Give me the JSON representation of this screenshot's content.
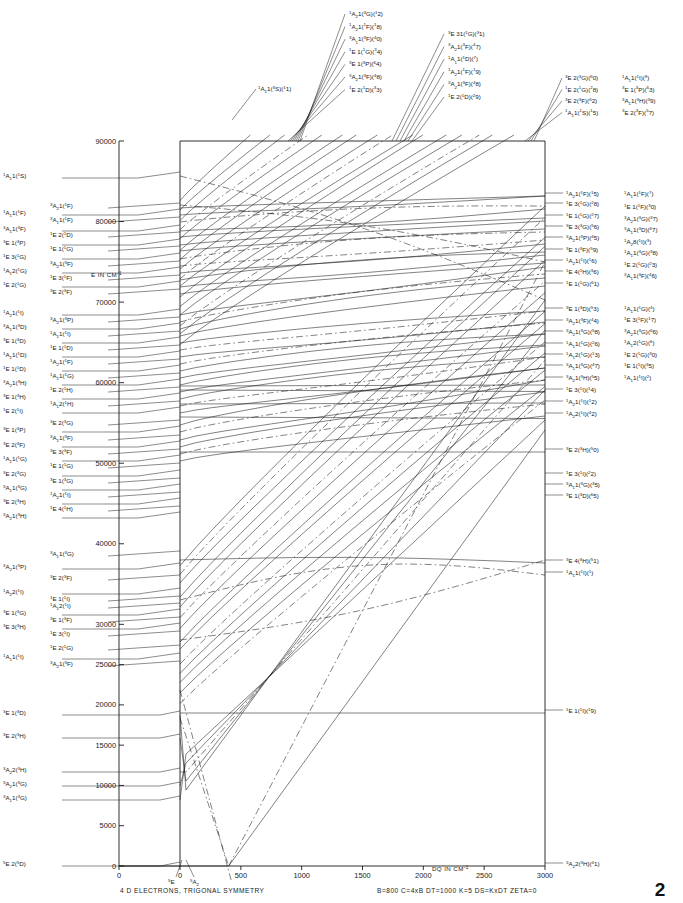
{
  "figure": {
    "caption": "4 D ELECTRONS, TRIGONAL SYMMETRY",
    "parameters": "B=800   C=4xB   DT=1000    K=5    DS=KxDT   ZETA=0",
    "page_number": "2"
  },
  "axes": {
    "y_title": "E IN CM",
    "y_title_sup": "-1",
    "y_ticks": [
      {
        "label": "0",
        "value": 0
      },
      {
        "label": "5000",
        "value": 5000
      },
      {
        "label": "10000",
        "value": 10000
      },
      {
        "label": "15000",
        "value": 15000
      },
      {
        "label": "20000",
        "value": 20000
      },
      {
        "label": "25000",
        "value": 25000
      },
      {
        "label": "30000",
        "value": 30000
      },
      {
        "label": "40000",
        "value": 40000
      },
      {
        "label": "50000",
        "value": 50000
      },
      {
        "label": "60000",
        "value": 60000
      },
      {
        "label": "70000",
        "value": 70000
      },
      {
        "label": "80000",
        "value": 80000
      },
      {
        "label": "90000",
        "value": 90000
      }
    ],
    "x_title": "DQ IN CM",
    "x_title_sup": "-1",
    "x_ticks": [
      "0",
      "500",
      "1000",
      "1500",
      "2000",
      "2500",
      "3000"
    ],
    "x_range": [
      0,
      3000
    ],
    "y_range": [
      0,
      90000
    ],
    "crossing_labels": [
      "5E",
      "5A2"
    ]
  },
  "left_labels_outer": [
    {
      "y": 178,
      "text": "1A11(1S)"
    },
    {
      "y": 215,
      "text": "1A11(1F)"
    },
    {
      "y": 231,
      "text": "3A11(3F)"
    },
    {
      "y": 245,
      "text": "3E 1(3P)"
    },
    {
      "y": 259,
      "text": "1E 3(1G)"
    },
    {
      "y": 273,
      "text": "1A12(1G)"
    },
    {
      "y": 287,
      "text": "1E 2(1G)"
    },
    {
      "y": 315,
      "text": "1A21(1I)"
    },
    {
      "y": 329,
      "text": "3A11(3D)"
    },
    {
      "y": 343,
      "text": "3E 1(3D)"
    },
    {
      "y": 357,
      "text": "1A11(1D)"
    },
    {
      "y": 371,
      "text": "1E 1(1D)"
    },
    {
      "y": 385,
      "text": "3A21(3H)"
    },
    {
      "y": 399,
      "text": "3E 1(3H)"
    },
    {
      "y": 413,
      "text": "1E 2(1I)"
    },
    {
      "y": 432,
      "text": "3E 1(3P)"
    },
    {
      "y": 447,
      "text": "3E 2(3F)"
    },
    {
      "y": 461,
      "text": "1A11(1G)"
    },
    {
      "y": 476,
      "text": "3E 2(3G)"
    },
    {
      "y": 490,
      "text": "3A11(3G)"
    },
    {
      "y": 504,
      "text": "3E 2(3H)"
    },
    {
      "y": 518,
      "text": "3A21(3H)"
    },
    {
      "y": 569,
      "text": "3A21(3P)"
    },
    {
      "y": 594,
      "text": "1A22(1I)"
    },
    {
      "y": 615,
      "text": "3E 1(3G)"
    },
    {
      "y": 629,
      "text": "3E 3(3H)"
    },
    {
      "y": 659,
      "text": "1A11(1I)"
    },
    {
      "y": 715,
      "text": "3E 1(3D)"
    },
    {
      "y": 738,
      "text": "3E 2(3H)"
    },
    {
      "y": 772,
      "text": "3A22(3H)"
    },
    {
      "y": 786,
      "text": "3A21(3G)"
    },
    {
      "y": 800,
      "text": "3A11(3G)"
    },
    {
      "y": 866,
      "text": "5E 2(5D)"
    }
  ],
  "left_labels_inner": [
    {
      "y": 208,
      "text": "3A21(1F)"
    },
    {
      "y": 222,
      "text": "3A11(1F)"
    },
    {
      "y": 237,
      "text": "1E 2(1D)"
    },
    {
      "y": 251,
      "text": "1E 1(1G)"
    },
    {
      "y": 266,
      "text": "3A21(3F)"
    },
    {
      "y": 280,
      "text": "1E 3(1F)"
    },
    {
      "y": 294,
      "text": "3E 2(3F)"
    },
    {
      "y": 322,
      "text": "3A21(3P)"
    },
    {
      "y": 336,
      "text": "1A11(1I)"
    },
    {
      "y": 350,
      "text": "1E 1(1D)"
    },
    {
      "y": 364,
      "text": "1A21(1F)"
    },
    {
      "y": 378,
      "text": "1A11(1G)"
    },
    {
      "y": 392,
      "text": "1E 2(1H)"
    },
    {
      "y": 406,
      "text": "1A12(1H)"
    },
    {
      "y": 425,
      "text": "3E 2(3G)"
    },
    {
      "y": 440,
      "text": "3A11(3F)"
    },
    {
      "y": 454,
      "text": "3E 3(3F)"
    },
    {
      "y": 468,
      "text": "1E 1(1G)"
    },
    {
      "y": 483,
      "text": "3E 1(3G)"
    },
    {
      "y": 497,
      "text": "1A21(1I)"
    },
    {
      "y": 511,
      "text": "1E 4(1H)"
    },
    {
      "y": 556,
      "text": "3A11(3G)"
    },
    {
      "y": 580,
      "text": "3E 2(3F)"
    },
    {
      "y": 601,
      "text": "1E 1(1I)"
    },
    {
      "y": 608,
      "text": "1A12(1I)"
    },
    {
      "y": 622,
      "text": "3E 1(3F)"
    },
    {
      "y": 636,
      "text": "1E 3(1I)"
    },
    {
      "y": 650,
      "text": "1E 2(1G)"
    },
    {
      "y": 666,
      "text": "3A21(3F)"
    }
  ],
  "top_labels_left": [
    {
      "text": "1A21(3G)(12)"
    },
    {
      "text": "1A21(1F)(18)"
    },
    {
      "text": "3A11(3F)(40)"
    },
    {
      "text": "1E 1(1G)(34)"
    },
    {
      "text": "3E 1(3P)(64)"
    },
    {
      "text": "3A21(3F)(48)"
    },
    {
      "text": "1E 2(1D)(33)"
    }
  ],
  "top_labels_right": [
    {
      "text": "3E 31(1G)(31)"
    },
    {
      "text": "3A21(3F)(47)"
    },
    {
      "text": "1A11(1D)(7)"
    },
    {
      "text": "1A21(1F)(19)"
    },
    {
      "text": "3A21(3F)(48)"
    },
    {
      "text": "1E 2(1D)(29)"
    }
  ],
  "top_label_single": {
    "text": "1A11(3S)(11)"
  },
  "top_right_block_a": [
    {
      "text": "3E 2(3G)(60)"
    },
    {
      "text": "1E 2(1G)(28)"
    },
    {
      "text": "3E 2(3F)(62)"
    },
    {
      "text": "1A11(1S)(15)"
    }
  ],
  "top_right_block_b": [
    {
      "text": "1A11(1I)(9)"
    },
    {
      "text": "3E 1(3P)(63)"
    },
    {
      "text": "3A11(3H)(39)"
    },
    {
      "text": "3E 2(3F)(57)"
    }
  ],
  "right_labels_col1": [
    {
      "y": 196,
      "text": "1A21(1F)(15)"
    },
    {
      "y": 206,
      "text": "1E 3(1G)(28)"
    },
    {
      "y": 218,
      "text": "1E 1(1G)(27)"
    },
    {
      "y": 229,
      "text": "3E 3(3G)(56)"
    },
    {
      "y": 240,
      "text": "3A21(3P)(45)"
    },
    {
      "y": 252,
      "text": "3E 1(3F)(59)"
    },
    {
      "y": 263,
      "text": "1A21(1I)(16)"
    },
    {
      "y": 274,
      "text": "1E 4(1H)(36)"
    },
    {
      "y": 286,
      "text": "1E 1(1G)(61)"
    },
    {
      "y": 311,
      "text": "3E 1(3D)(53)"
    },
    {
      "y": 323,
      "text": "3A21(3F)(44)"
    },
    {
      "y": 334,
      "text": "3A21(3G)(58)"
    },
    {
      "y": 346,
      "text": "1A11(1G)(26)"
    },
    {
      "y": 357,
      "text": "1A12(1G)(13)"
    },
    {
      "y": 368,
      "text": "3A11(3G)(47)"
    },
    {
      "y": 380,
      "text": "3A21(3H)(55)"
    },
    {
      "y": 392,
      "text": "1E 3(1I)(14)"
    },
    {
      "y": 404,
      "text": "1A21(1I)(12)"
    },
    {
      "y": 416,
      "text": "1A22(1I)(42)"
    },
    {
      "y": 452,
      "text": "3E 2(3H)(50)"
    },
    {
      "y": 476,
      "text": "1E 3(1I)(22)"
    },
    {
      "y": 487,
      "text": "3A11(3G)(35)"
    },
    {
      "y": 498,
      "text": "3E 1(3D)(65)"
    },
    {
      "y": 563,
      "text": "3E 4(3H)(51)"
    },
    {
      "y": 575,
      "text": "1A11(1I)(1)"
    },
    {
      "y": 713,
      "text": "1E 1(1I)(19)"
    },
    {
      "y": 866,
      "text": "3A22(3H)(41)"
    }
  ],
  "right_labels_col2": [
    {
      "y": 196,
      "text": "1A11(1F)(7)"
    },
    {
      "y": 209,
      "text": "1E 1(1F)(30)"
    },
    {
      "y": 221,
      "text": "3A21(3G)(37)"
    },
    {
      "y": 232,
      "text": "3A11(3D)(67)"
    },
    {
      "y": 244,
      "text": "1A28(1I)(3)"
    },
    {
      "y": 255,
      "text": "1A11(3G)(38)"
    },
    {
      "y": 267,
      "text": "1E 2(1G)(23)"
    },
    {
      "y": 278,
      "text": "3A11(3F)(46)"
    },
    {
      "y": 311,
      "text": "1A11(1G)(4)"
    },
    {
      "y": 322,
      "text": "1E 3(1F)(17)"
    },
    {
      "y": 334,
      "text": "3A21(3G)(66)"
    },
    {
      "y": 345,
      "text": "1A12(1G)(6)"
    },
    {
      "y": 357,
      "text": "1E 2(1G)(30)"
    },
    {
      "y": 368,
      "text": "1E 1(1I)(35)"
    },
    {
      "y": 380,
      "text": "1A11(1I)(2)"
    }
  ],
  "colors": {
    "line": "#1a1a1a",
    "background": "#ffffff"
  }
}
